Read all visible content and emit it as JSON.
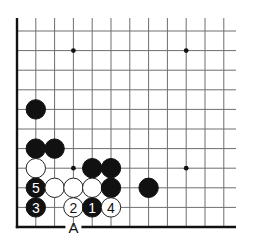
{
  "board": {
    "origin_x": 17,
    "origin_y": 31,
    "col_spacing": 18.8,
    "row_spacing": 19.6,
    "cols": 12,
    "rows": 11,
    "line_top_y": 18,
    "line_right_x": 236,
    "left_edge": true,
    "bottom_edge": true,
    "stone_radius": 10,
    "colors": {
      "black": "#111111",
      "white": "#ffffff",
      "line": "#6e6e6e",
      "edge": "#111111"
    }
  },
  "hoshi": [
    {
      "col": 3,
      "row": 1
    },
    {
      "col": 9,
      "row": 1
    },
    {
      "col": 3,
      "row": 7
    },
    {
      "col": 9,
      "row": 7
    }
  ],
  "stones": [
    {
      "color": "black",
      "col": 1,
      "row": 4,
      "label": ""
    },
    {
      "color": "black",
      "col": 1,
      "row": 6,
      "label": ""
    },
    {
      "color": "black",
      "col": 2,
      "row": 6,
      "label": ""
    },
    {
      "color": "white",
      "col": 1,
      "row": 7,
      "label": ""
    },
    {
      "color": "black",
      "col": 4,
      "row": 7,
      "label": ""
    },
    {
      "color": "black",
      "col": 5,
      "row": 7,
      "label": ""
    },
    {
      "color": "black",
      "col": 1,
      "row": 8,
      "label": "5"
    },
    {
      "color": "white",
      "col": 2,
      "row": 8,
      "label": ""
    },
    {
      "color": "white",
      "col": 3,
      "row": 8,
      "label": ""
    },
    {
      "color": "white",
      "col": 4,
      "row": 8,
      "label": ""
    },
    {
      "color": "black",
      "col": 5,
      "row": 8,
      "label": ""
    },
    {
      "color": "black",
      "col": 7,
      "row": 8,
      "label": ""
    },
    {
      "color": "black",
      "col": 1,
      "row": 9,
      "label": "3"
    },
    {
      "color": "white",
      "col": 3,
      "row": 9,
      "label": "2"
    },
    {
      "color": "black",
      "col": 4,
      "row": 9,
      "label": "1"
    },
    {
      "color": "white",
      "col": 5,
      "row": 9,
      "label": "4"
    }
  ],
  "markers": [
    {
      "text": "A",
      "col": 3,
      "row": 10
    }
  ]
}
